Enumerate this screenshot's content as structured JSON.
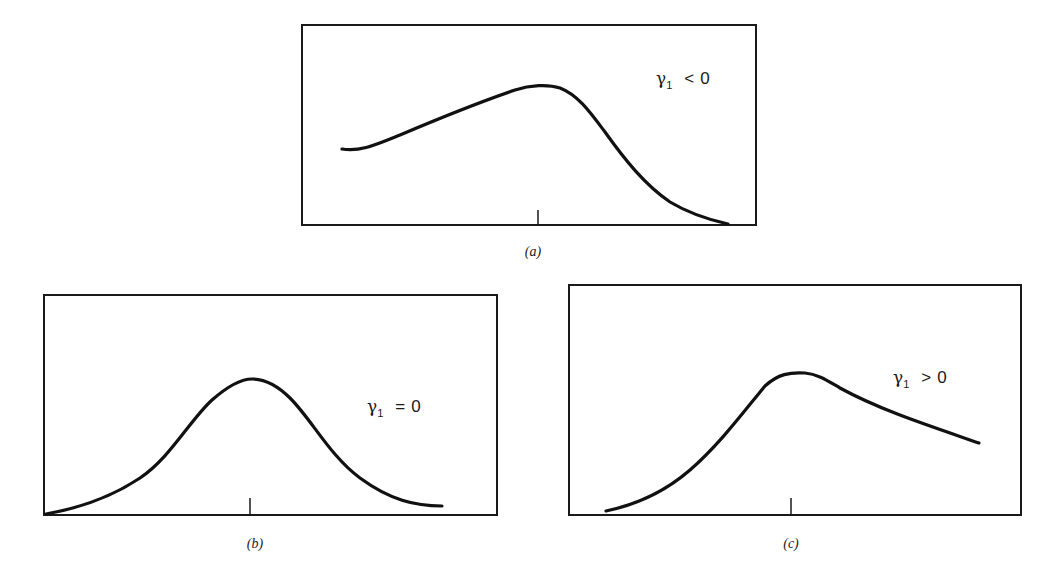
{
  "figure": {
    "panels": [
      {
        "id": "a",
        "caption": "(a)",
        "label": {
          "symbol": "γ",
          "subscript": "1",
          "operator": "<",
          "value": "0"
        },
        "description": "negatively skewed distribution"
      },
      {
        "id": "b",
        "caption": "(b)",
        "label": {
          "symbol": "γ",
          "subscript": "1",
          "operator": "=",
          "value": "0"
        },
        "description": "symmetric distribution"
      },
      {
        "id": "c",
        "caption": "(c)",
        "label": {
          "symbol": "γ",
          "subscript": "1",
          "operator": ">",
          "value": "0"
        },
        "description": "positively skewed distribution"
      }
    ]
  },
  "colors": {
    "ink": "#1a1a1a",
    "background": "#ffffff"
  }
}
